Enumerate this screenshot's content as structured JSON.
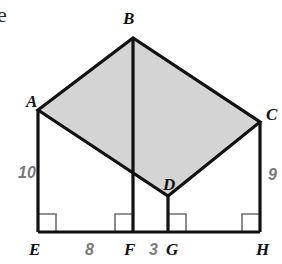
{
  "figure": {
    "kind": "geometry-diagram",
    "colors": {
      "shade_fill": "#d4d4d4",
      "stroke": "#111111",
      "thin_stroke": "#6f6f6f",
      "measure_text": "#7a7a7a",
      "vertex_text": "#111111",
      "background": "#ffffff"
    },
    "stray_text": "e",
    "vertices": [
      {
        "id": "A",
        "label": "A",
        "x": 38,
        "y": 110,
        "label_x": 26,
        "label_y": 107
      },
      {
        "id": "B",
        "label": "B",
        "x": 133,
        "y": 38,
        "label_x": 123,
        "label_y": 24
      },
      {
        "id": "C",
        "label": "C",
        "x": 260,
        "y": 122,
        "label_x": 266,
        "label_y": 120
      },
      {
        "id": "D",
        "label": "D",
        "x": 168,
        "y": 196,
        "label_x": 163,
        "label_y": 190
      },
      {
        "id": "E",
        "label": "E",
        "x": 38,
        "y": 232,
        "label_x": 29,
        "label_y": 255
      },
      {
        "id": "F",
        "label": "F",
        "x": 133,
        "y": 232,
        "label_x": 124,
        "label_y": 255
      },
      {
        "id": "G",
        "label": "G",
        "x": 168,
        "y": 232,
        "label_x": 166,
        "label_y": 255
      },
      {
        "id": "H",
        "label": "H",
        "x": 260,
        "y": 232,
        "label_x": 256,
        "label_y": 255
      }
    ],
    "shaded_polygon": {
      "name": "quadrilateral-ABCD",
      "points": "38,110 133,38 260,122 168,196"
    },
    "segments": [
      {
        "name": "segment-AE",
        "x1": 38,
        "y1": 110,
        "x2": 38,
        "y2": 232
      },
      {
        "name": "segment-CH",
        "x1": 260,
        "y1": 122,
        "x2": 260,
        "y2": 232
      },
      {
        "name": "segment-BF",
        "x1": 133,
        "y1": 38,
        "x2": 133,
        "y2": 232
      },
      {
        "name": "segment-DG",
        "x1": 168,
        "y1": 196,
        "x2": 168,
        "y2": 232
      },
      {
        "name": "segment-EH-baseline",
        "x1": 38,
        "y1": 232,
        "x2": 260,
        "y2": 232
      }
    ],
    "right_angle_marks": [
      {
        "name": "right-angle-at-E",
        "x": 38,
        "y": 232,
        "dx": 1,
        "size": 18
      },
      {
        "name": "right-angle-at-F",
        "x": 133,
        "y": 232,
        "dx": -1,
        "size": 18
      },
      {
        "name": "right-angle-at-G",
        "x": 168,
        "y": 232,
        "dx": 1,
        "size": 18
      },
      {
        "name": "right-angle-at-H",
        "x": 260,
        "y": 232,
        "dx": -1,
        "size": 18
      }
    ],
    "measures": [
      {
        "name": "measure-AE",
        "value": "10",
        "x": 18,
        "y": 178,
        "segment": "AE"
      },
      {
        "name": "measure-CH",
        "value": "9",
        "x": 268,
        "y": 180,
        "segment": "CH"
      },
      {
        "name": "measure-EF",
        "value": "8",
        "x": 85,
        "y": 255,
        "segment": "EF"
      },
      {
        "name": "measure-FG",
        "value": "3",
        "x": 149,
        "y": 255,
        "segment": "FG"
      }
    ]
  }
}
